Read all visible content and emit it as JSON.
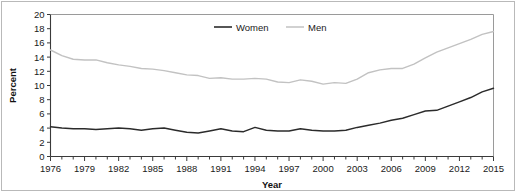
{
  "chart_data": {
    "type": "line",
    "title": "",
    "xlabel": "Year",
    "ylabel": "Percent",
    "xlim": [
      1976,
      2015
    ],
    "ylim": [
      0,
      20
    ],
    "ytick_step": 2,
    "grid": false,
    "legend_position": "top-center",
    "x": [
      1976,
      1977,
      1978,
      1979,
      1980,
      1981,
      1982,
      1983,
      1984,
      1985,
      1986,
      1987,
      1988,
      1989,
      1990,
      1991,
      1992,
      1993,
      1994,
      1995,
      1996,
      1997,
      1998,
      1999,
      2000,
      2001,
      2002,
      2003,
      2004,
      2005,
      2006,
      2007,
      2008,
      2009,
      2010,
      2011,
      2012,
      2013,
      2014,
      2015
    ],
    "xticks": [
      1976,
      1979,
      1982,
      1985,
      1988,
      1991,
      1994,
      1997,
      2000,
      2003,
      2006,
      2009,
      2012,
      2015
    ],
    "xtick_labels": [
      "1976",
      "1979",
      "1982",
      "1985",
      "1988",
      "1991",
      "1994",
      "1997",
      "2000",
      "2003",
      "2006",
      "2009",
      "2012",
      "2015"
    ],
    "yticks": [
      0,
      2,
      4,
      6,
      8,
      10,
      12,
      14,
      16,
      18,
      20
    ],
    "ytick_labels": [
      "0",
      "2",
      "4",
      "6",
      "8",
      "10",
      "12",
      "14",
      "16",
      "18",
      "20"
    ],
    "series": [
      {
        "name": "Women",
        "color": "#2b2b2b",
        "values": [
          4.2,
          4.0,
          3.9,
          3.9,
          3.8,
          3.9,
          4.0,
          3.9,
          3.7,
          3.9,
          4.0,
          3.7,
          3.4,
          3.3,
          3.6,
          3.9,
          3.6,
          3.5,
          4.1,
          3.7,
          3.6,
          3.6,
          3.9,
          3.7,
          3.6,
          3.6,
          3.7,
          4.1,
          4.4,
          4.7,
          5.1,
          5.4,
          5.9,
          6.4,
          6.5,
          7.1,
          7.7,
          8.3,
          9.1,
          9.6
        ]
      },
      {
        "name": "Men",
        "color": "#c2c2c2",
        "values": [
          15.0,
          14.2,
          13.7,
          13.6,
          13.6,
          13.2,
          12.9,
          12.7,
          12.4,
          12.3,
          12.1,
          11.8,
          11.5,
          11.4,
          11.0,
          11.1,
          10.9,
          10.9,
          11.0,
          10.9,
          10.5,
          10.4,
          10.8,
          10.6,
          10.2,
          10.4,
          10.3,
          10.9,
          11.8,
          12.2,
          12.4,
          12.4,
          13.0,
          13.9,
          14.7,
          15.3,
          15.9,
          16.5,
          17.2,
          17.6
        ]
      }
    ],
    "legend": [
      {
        "label": "Women",
        "color": "#2b2b2b"
      },
      {
        "label": "Men",
        "color": "#c2c2c2"
      }
    ]
  }
}
